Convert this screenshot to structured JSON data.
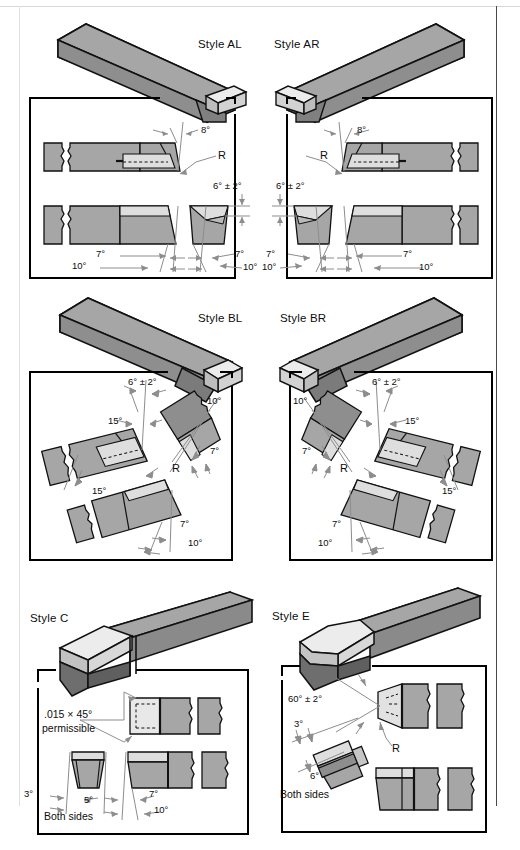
{
  "figure": {
    "kind": "technical-drawing",
    "panel_count": 6
  },
  "palette": {
    "paper": "#ffffff",
    "line": "#111111",
    "shank_top": "#9a9a9a",
    "shank_side": "#7e7e7e",
    "shank_dark": "#6e6e6e",
    "insert_light": "#dedede",
    "insert_mid": "#c9c9c9",
    "section_fill": "#a6a6a6",
    "section_light": "#d5d5d5",
    "panel_border": "#000000"
  },
  "panels": [
    {
      "id": "al",
      "title": "Style AL",
      "title_align": "right",
      "dims": [
        {
          "text": "8°"
        },
        {
          "text": "R"
        },
        {
          "text": "6° ± 2°"
        },
        {
          "text": "7°"
        },
        {
          "text": "10°"
        },
        {
          "text": "7°"
        },
        {
          "text": "10°"
        }
      ]
    },
    {
      "id": "ar",
      "title": "Style AR",
      "title_align": "left",
      "dims": [
        {
          "text": "8°"
        },
        {
          "text": "R"
        },
        {
          "text": "6° ± 2°"
        },
        {
          "text": "7°"
        },
        {
          "text": "10°"
        },
        {
          "text": "7°"
        },
        {
          "text": "10°"
        }
      ]
    },
    {
      "id": "bl",
      "title": "Style BL",
      "title_align": "right",
      "dims": [
        {
          "text": "6° ± 2°"
        },
        {
          "text": "10°"
        },
        {
          "text": "15°"
        },
        {
          "text": "7°"
        },
        {
          "text": "R"
        },
        {
          "text": "15°"
        },
        {
          "text": "7°"
        },
        {
          "text": "10°"
        }
      ]
    },
    {
      "id": "br",
      "title": "Style BR",
      "title_align": "left",
      "dims": [
        {
          "text": "6° ± 2°"
        },
        {
          "text": "10°"
        },
        {
          "text": "7°"
        },
        {
          "text": "15°"
        },
        {
          "text": "R"
        },
        {
          "text": "15°"
        },
        {
          "text": "7°"
        },
        {
          "text": "10°"
        }
      ]
    },
    {
      "id": "c",
      "title": "Style C",
      "title_align": "left",
      "dims": [
        {
          "text": ".015 × 45°"
        },
        {
          "text": "permissible"
        },
        {
          "text": "3°"
        },
        {
          "text": "5°"
        },
        {
          "text": "7°"
        },
        {
          "text": "10°"
        },
        {
          "text": "Both sides"
        }
      ]
    },
    {
      "id": "e",
      "title": "Style E",
      "title_align": "left",
      "dims": [
        {
          "text": "60° ± 2°"
        },
        {
          "text": "R"
        },
        {
          "text": "3°"
        },
        {
          "text": "6°"
        },
        {
          "text": "Both sides"
        }
      ]
    }
  ],
  "text": {
    "al_title": "Style AL",
    "ar_title": "Style AR",
    "bl_title": "Style BL",
    "br_title": "Style BR",
    "c_title": "Style C",
    "e_title": "Style E",
    "al_8": "8°",
    "al_R": "R",
    "al_6pm2": "6° ± 2°",
    "al_7a": "7°",
    "al_10a": "10°",
    "al_7b": "7°",
    "al_10b": "10°",
    "ar_8": "8°",
    "ar_R": "R",
    "ar_6pm2": "6° ± 2°",
    "ar_7a": "7°",
    "ar_10a": "10°",
    "ar_7b": "7°",
    "ar_10b": "10°",
    "bl_6pm2": "6° ± 2°",
    "bl_10a": "10°",
    "bl_15a": "15°",
    "bl_7a": "7°",
    "bl_R": "R",
    "bl_15b": "15°",
    "bl_7b": "7°",
    "bl_10b": "10°",
    "br_6pm2": "6° ± 2°",
    "br_10a": "10°",
    "br_7a": "7°",
    "br_15a": "15°",
    "br_R": "R",
    "br_15b": "15°",
    "br_7b": "7°",
    "br_10b": "10°",
    "c_chamfer": ".015 × 45°",
    "c_permissible": "permissible",
    "c_3": "3°",
    "c_5": "5°",
    "c_7": "7°",
    "c_10": "10°",
    "c_both": "Both sides",
    "e_60pm2": "60° ± 2°",
    "e_R": "R",
    "e_3": "3°",
    "e_6": "6°",
    "e_both": "Both sides"
  }
}
